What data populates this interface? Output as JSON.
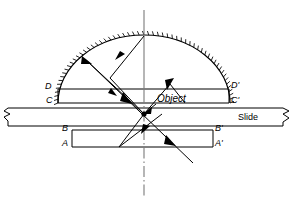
{
  "figure": {
    "type": "optical-ray-diagram",
    "title_visible": false,
    "background_color": "#ffffff",
    "stroke_color": "#000000",
    "width": 299,
    "height": 203
  },
  "labels": {
    "d_left": "D",
    "d_right": "D'",
    "c_left": "C",
    "c_right": "C'",
    "b_left": "B",
    "b_right": "B'",
    "a_left": "A",
    "a_right": "A'",
    "slide": "Slide",
    "object": "Object"
  },
  "elements": {
    "dome": {
      "name": "hemispherical-dome-mirror",
      "center_x": 144,
      "center_y": 103,
      "radius_x": 86,
      "radius_y": 68,
      "hatched": true,
      "hatch_count": 56,
      "hatch_length": 4
    },
    "upper_block": {
      "name": "upper-rectangle-CD",
      "left": 58,
      "right": 229,
      "top": 89,
      "bottom": 103,
      "top_label_left": "D",
      "top_label_right": "D'",
      "bottom_label_left": "C",
      "bottom_label_right": "C'"
    },
    "lower_block": {
      "name": "lower-rectangle-AB",
      "left": 72,
      "right": 213,
      "top": 130,
      "bottom": 147,
      "top_label_left": "B",
      "top_label_right": "B'",
      "bottom_label_left": "A",
      "bottom_label_right": "A'"
    },
    "slide": {
      "name": "microscope-slide",
      "left": 4,
      "right": 295,
      "top": 108,
      "bottom": 126,
      "label": "Slide",
      "break_symbols": [
        "left",
        "right"
      ]
    },
    "optical_axis": {
      "name": "optical-axis-centerline",
      "x": 144,
      "top": 10,
      "bottom": 196,
      "style": "dash-dot"
    },
    "object_point": {
      "name": "object-focal-point",
      "x": 144,
      "y": 114
    }
  },
  "rays": [
    {
      "name": "ray-incident-upper-left",
      "from": [
        85,
        59
      ],
      "to": [
        144,
        114
      ]
    },
    {
      "name": "ray-incident-upper-right",
      "from": [
        144,
        36
      ],
      "to": [
        110,
        78
      ]
    },
    {
      "name": "ray-reflected-left-v",
      "from": [
        110,
        78
      ],
      "to": [
        144,
        114
      ]
    },
    {
      "name": "ray-reflected-apex",
      "from": [
        144,
        114
      ],
      "to": [
        170,
        84
      ]
    },
    {
      "name": "ray-down-left-v",
      "from": [
        144,
        114
      ],
      "to": [
        119,
        147
      ]
    },
    {
      "name": "ray-up-right-v",
      "from": [
        119,
        147
      ],
      "to": [
        162,
        114
      ]
    },
    {
      "name": "ray-long-diagonal",
      "from": [
        85,
        59
      ],
      "to": [
        193,
        163
      ]
    }
  ],
  "colors": {
    "line": "#000000",
    "background": "#ffffff"
  }
}
